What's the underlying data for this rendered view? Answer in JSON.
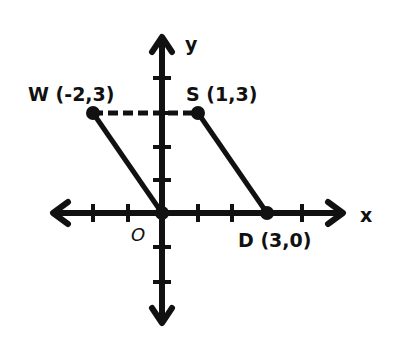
{
  "diagram": {
    "type": "coordinate-plane",
    "axes": {
      "x_label": "x",
      "y_label": "y",
      "origin_label": "O"
    },
    "points": [
      {
        "name": "W",
        "label": "W (-2,3)",
        "x": -2,
        "y": 3
      },
      {
        "name": "S",
        "label": "S (1,3)",
        "x": 1,
        "y": 3
      },
      {
        "name": "D",
        "label": "D (3,0)",
        "x": 3,
        "y": 0
      },
      {
        "name": "O",
        "label": "O",
        "x": 0,
        "y": 0
      }
    ],
    "segments": [
      {
        "from": "W",
        "to": "O",
        "style": "solid"
      },
      {
        "from": "S",
        "to": "D",
        "style": "solid"
      },
      {
        "from": "W",
        "to": "S",
        "style": "dashed"
      }
    ],
    "colors": {
      "ink": "#111111",
      "background": "#ffffff"
    }
  }
}
